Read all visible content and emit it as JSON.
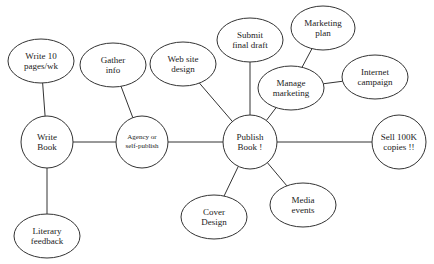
{
  "diagram": {
    "type": "mind-map",
    "stroke_color": "#333333",
    "background": "#ffffff",
    "nodes": [
      {
        "id": "write10",
        "label": "Write 10\npages/wk",
        "shape": "ellipse",
        "cx": 41,
        "cy": 61,
        "rx": 33,
        "ry": 22
      },
      {
        "id": "gather",
        "label": "Gather\ninfo",
        "shape": "ellipse",
        "cx": 113,
        "cy": 65,
        "rx": 33,
        "ry": 22
      },
      {
        "id": "website",
        "label": "Web site\ndesign",
        "shape": "ellipse",
        "cx": 183,
        "cy": 64,
        "rx": 33,
        "ry": 22
      },
      {
        "id": "submit",
        "label": "Submit\nfinal draft",
        "shape": "ellipse",
        "cx": 250,
        "cy": 40,
        "rx": 33,
        "ry": 22
      },
      {
        "id": "mktplan",
        "label": "Marketing\nplan",
        "shape": "ellipse",
        "cx": 323,
        "cy": 28,
        "rx": 32,
        "ry": 22
      },
      {
        "id": "managemkt",
        "label": "Manage\nmarketing",
        "shape": "ellipse",
        "cx": 291,
        "cy": 88,
        "rx": 33,
        "ry": 22
      },
      {
        "id": "internet",
        "label": "Internet\ncampaign",
        "shape": "ellipse",
        "cx": 375,
        "cy": 77,
        "rx": 33,
        "ry": 22
      },
      {
        "id": "writebook",
        "label": "Write\nBook",
        "shape": "circle",
        "cx": 47,
        "cy": 142,
        "rx": 26,
        "ry": 26
      },
      {
        "id": "agency",
        "label": "Agency or\nself-publish",
        "shape": "circle",
        "cx": 142,
        "cy": 142,
        "rx": 26,
        "ry": 26,
        "small": true
      },
      {
        "id": "publish",
        "label": "Publish\nBook !",
        "shape": "circle",
        "cx": 250,
        "cy": 142,
        "rx": 27,
        "ry": 27
      },
      {
        "id": "sell",
        "label": "Sell 100K\ncopies !!",
        "shape": "circle",
        "cx": 399,
        "cy": 142,
        "rx": 27,
        "ry": 27
      },
      {
        "id": "literary",
        "label": "Literary\nfeedback",
        "shape": "ellipse",
        "cx": 47,
        "cy": 236,
        "rx": 33,
        "ry": 22
      },
      {
        "id": "cover",
        "label": "Cover\nDesign",
        "shape": "ellipse",
        "cx": 214,
        "cy": 217,
        "rx": 33,
        "ry": 22
      },
      {
        "id": "media",
        "label": "Media\nevents",
        "shape": "ellipse",
        "cx": 303,
        "cy": 205,
        "rx": 33,
        "ry": 22
      }
    ],
    "edges": [
      {
        "from": "write10",
        "to": "writebook"
      },
      {
        "from": "writebook",
        "to": "literary"
      },
      {
        "from": "writebook",
        "to": "agency"
      },
      {
        "from": "gather",
        "to": "agency"
      },
      {
        "from": "agency",
        "to": "publish"
      },
      {
        "from": "website",
        "to": "publish"
      },
      {
        "from": "submit",
        "to": "publish"
      },
      {
        "from": "managemkt",
        "to": "publish"
      },
      {
        "from": "mktplan",
        "to": "managemkt"
      },
      {
        "from": "managemkt",
        "to": "internet"
      },
      {
        "from": "publish",
        "to": "sell"
      },
      {
        "from": "publish",
        "to": "cover"
      },
      {
        "from": "publish",
        "to": "media"
      }
    ]
  }
}
